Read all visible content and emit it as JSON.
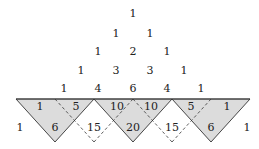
{
  "colors": {
    "fill": "#dcdcdc",
    "stroke": "#333333",
    "text": "#222222"
  },
  "rows": [
    {
      "y": 14,
      "cells": [
        {
          "x": 133,
          "v": "1"
        }
      ]
    },
    {
      "y": 34,
      "cells": [
        {
          "x": 116,
          "v": "1"
        },
        {
          "x": 150,
          "v": "1"
        }
      ]
    },
    {
      "y": 52,
      "cells": [
        {
          "x": 98,
          "v": "1"
        },
        {
          "x": 133,
          "v": "2"
        },
        {
          "x": 167,
          "v": "1"
        }
      ]
    },
    {
      "y": 71,
      "cells": [
        {
          "x": 81,
          "v": "1"
        },
        {
          "x": 116,
          "v": "3"
        },
        {
          "x": 150,
          "v": "3"
        },
        {
          "x": 184,
          "v": "1"
        }
      ]
    },
    {
      "y": 89,
      "cells": [
        {
          "x": 64,
          "v": "1"
        },
        {
          "x": 98,
          "v": "4"
        },
        {
          "x": 133,
          "v": "6"
        },
        {
          "x": 167,
          "v": "4"
        },
        {
          "x": 201,
          "v": "1"
        }
      ]
    },
    {
      "y": 107,
      "cells": [
        {
          "x": 40,
          "v": "1"
        },
        {
          "x": 76,
          "v": "5"
        },
        {
          "x": 117,
          "v": "10"
        },
        {
          "x": 151,
          "v": "10"
        },
        {
          "x": 191,
          "v": "5"
        },
        {
          "x": 227,
          "v": "1"
        }
      ]
    },
    {
      "y": 128,
      "cells": [
        {
          "x": 20,
          "v": "1"
        },
        {
          "x": 55,
          "v": "6"
        },
        {
          "x": 94,
          "v": "15"
        },
        {
          "x": 133,
          "v": "20"
        },
        {
          "x": 172,
          "v": "15"
        },
        {
          "x": 211,
          "v": "6"
        },
        {
          "x": 247,
          "v": "1"
        }
      ]
    }
  ],
  "grey_triangles": [
    "16,99 94,99 55,142",
    "94,99 172,99 133,142",
    "172,99 250,99 211,142"
  ],
  "dashed_lines": [
    "55,99 94,142",
    "94,142 133,99",
    "133,99 172,142",
    "172,142 211,99"
  ]
}
